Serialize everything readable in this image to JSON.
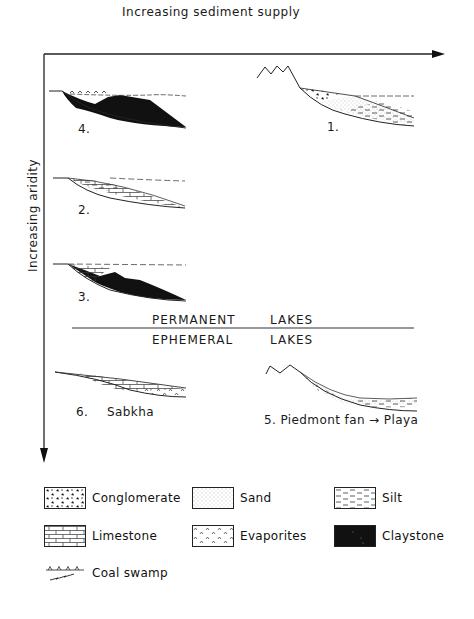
{
  "axes": {
    "x_label": "Increasing sediment supply",
    "y_label": "Increasing aridity"
  },
  "panels": [
    {
      "id": "1",
      "label": "1."
    },
    {
      "id": "2",
      "label": "2."
    },
    {
      "id": "3",
      "label": "3."
    },
    {
      "id": "4",
      "label": "4."
    },
    {
      "id": "5",
      "label": "5.  Piedmont fan → Playa"
    },
    {
      "id": "6",
      "label_num": "6.",
      "label_name": "Sabkha"
    }
  ],
  "divider": {
    "above": {
      "word1": "PERMANENT",
      "word2": "LAKES"
    },
    "below": {
      "word1": "EPHEMERAL",
      "word2": "LAKES"
    }
  },
  "legend": [
    {
      "key": "conglomerate",
      "label": "Conglomerate"
    },
    {
      "key": "sand",
      "label": "Sand"
    },
    {
      "key": "silt",
      "label": "Silt"
    },
    {
      "key": "limestone",
      "label": "Limestone"
    },
    {
      "key": "evaporites",
      "label": "Evaporites"
    },
    {
      "key": "claystone",
      "label": "Claystone"
    },
    {
      "key": "coal-swamp",
      "label": "Coal swamp"
    }
  ]
}
